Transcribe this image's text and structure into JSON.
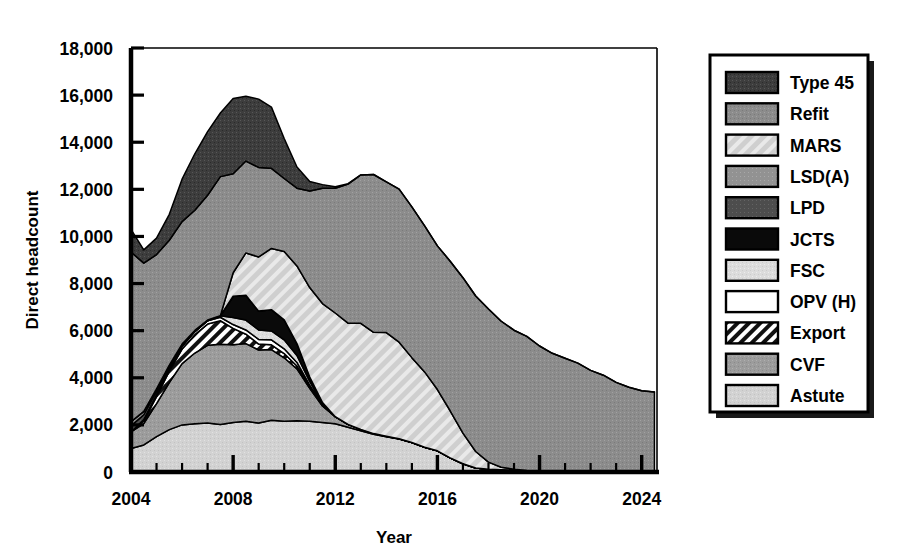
{
  "chart_data": {
    "type": "area",
    "stacked": true,
    "title": "",
    "xlabel": "Year",
    "ylabel": "Direct headcount",
    "xlim": [
      2004,
      2024.6
    ],
    "ylim": [
      0,
      18000
    ],
    "ytick_step": 2000,
    "xtick_major_step": 4,
    "xtick_minor_step": 1,
    "grid": false,
    "legend_position": "right-outside",
    "xticks": [
      2004,
      2008,
      2012,
      2016,
      2020,
      2024
    ],
    "xtick_labels": [
      "2004",
      "2008",
      "2012",
      "2016",
      "2020",
      "2024"
    ],
    "yticks": [
      0,
      2000,
      4000,
      6000,
      8000,
      10000,
      12000,
      14000,
      16000,
      18000
    ],
    "ytick_labels": [
      "0",
      "2,000",
      "4,000",
      "6,000",
      "8,000",
      "10,000",
      "12,000",
      "14,000",
      "16,000",
      "18,000"
    ],
    "x": [
      2004.0,
      2004.5,
      2005.0,
      2005.5,
      2006.0,
      2006.5,
      2007.0,
      2007.5,
      2008.0,
      2008.5,
      2009.0,
      2009.5,
      2010.0,
      2010.5,
      2011.0,
      2011.5,
      2012.0,
      2012.5,
      2013.0,
      2013.5,
      2014.0,
      2014.5,
      2015.0,
      2015.5,
      2016.0,
      2016.5,
      2017.0,
      2017.5,
      2018.0,
      2018.5,
      2019.0,
      2019.5,
      2020.0,
      2020.5,
      2021.0,
      2021.5,
      2022.0,
      2022.5,
      2023.0,
      2023.5,
      2024.0,
      2024.5
    ],
    "series": [
      {
        "name": "Astute",
        "swatch": "fill-astute",
        "values": [
          1000,
          1150,
          1500,
          1800,
          2000,
          2050,
          2080,
          2020,
          2100,
          2150,
          2080,
          2200,
          2150,
          2180,
          2150,
          2100,
          2050,
          1900,
          1750,
          1600,
          1500,
          1400,
          1250,
          1050,
          900,
          600,
          350,
          170,
          120,
          100,
          80,
          60,
          50,
          40,
          30,
          20,
          15,
          10,
          5,
          0,
          0,
          0
        ]
      },
      {
        "name": "CVF",
        "swatch": "fill-cvf",
        "values": [
          700,
          900,
          1400,
          2000,
          2600,
          3000,
          3300,
          3400,
          3300,
          3300,
          3100,
          3000,
          2700,
          2200,
          1400,
          700,
          300,
          120,
          60,
          30,
          20,
          10,
          5,
          0,
          0,
          0,
          0,
          0,
          0,
          0,
          0,
          0,
          0,
          0,
          0,
          0,
          0,
          0,
          0,
          0,
          0,
          0
        ]
      },
      {
        "name": "Export",
        "swatch": "fill-export",
        "values": [
          0,
          120,
          300,
          480,
          620,
          780,
          900,
          1000,
          700,
          400,
          250,
          200,
          180,
          120,
          60,
          20,
          0,
          0,
          0,
          0,
          0,
          0,
          0,
          0,
          0,
          0,
          0,
          0,
          0,
          0,
          0,
          0,
          0,
          0,
          0,
          0,
          0,
          0,
          0,
          0,
          0,
          0
        ]
      },
      {
        "name": "OPV (H)",
        "swatch": "fill-opv",
        "values": [
          0,
          60,
          90,
          110,
          120,
          130,
          140,
          150,
          160,
          180,
          200,
          210,
          200,
          150,
          80,
          30,
          0,
          0,
          0,
          0,
          0,
          0,
          0,
          0,
          0,
          0,
          0,
          0,
          0,
          0,
          0,
          0,
          0,
          0,
          0,
          0,
          0,
          0,
          0,
          0,
          0,
          0
        ]
      },
      {
        "name": "FSC",
        "swatch": "fill-fsc",
        "values": [
          0,
          0,
          0,
          0,
          0,
          0,
          0,
          60,
          300,
          420,
          400,
          380,
          380,
          300,
          160,
          60,
          0,
          0,
          0,
          0,
          0,
          0,
          0,
          0,
          0,
          0,
          0,
          0,
          0,
          0,
          0,
          0,
          0,
          0,
          0,
          0,
          0,
          0,
          0,
          0,
          0,
          0
        ]
      },
      {
        "name": "JCTS",
        "swatch": "fill-jcts",
        "values": [
          0,
          0,
          0,
          0,
          0,
          0,
          0,
          0,
          900,
          1050,
          800,
          900,
          850,
          500,
          180,
          40,
          0,
          0,
          0,
          0,
          0,
          0,
          0,
          0,
          0,
          0,
          0,
          0,
          0,
          0,
          0,
          0,
          0,
          0,
          0,
          0,
          0,
          0,
          0,
          0,
          0,
          0
        ]
      },
      {
        "name": "LPD",
        "swatch": "fill-lpd",
        "values": [
          260,
          200,
          140,
          90,
          50,
          30,
          20,
          10,
          0,
          0,
          0,
          0,
          0,
          0,
          0,
          0,
          0,
          0,
          0,
          0,
          0,
          0,
          0,
          0,
          0,
          0,
          0,
          0,
          0,
          0,
          0,
          0,
          0,
          0,
          0,
          0,
          0,
          0,
          0,
          0,
          0,
          0
        ]
      },
      {
        "name": "LSD(A)",
        "swatch": "fill-lsda",
        "values": [
          180,
          140,
          100,
          60,
          40,
          20,
          10,
          0,
          0,
          0,
          0,
          0,
          0,
          0,
          0,
          0,
          0,
          0,
          0,
          0,
          0,
          0,
          0,
          0,
          0,
          0,
          0,
          0,
          0,
          0,
          0,
          0,
          0,
          0,
          0,
          0,
          0,
          0,
          0,
          0,
          0,
          0
        ]
      },
      {
        "name": "MARS",
        "swatch": "fill-mars",
        "values": [
          0,
          0,
          0,
          0,
          0,
          0,
          0,
          0,
          1000,
          1800,
          2300,
          2600,
          2900,
          3300,
          3800,
          4200,
          4400,
          4300,
          4500,
          4300,
          4400,
          4100,
          3600,
          3200,
          2600,
          2000,
          1300,
          700,
          300,
          100,
          40,
          0,
          0,
          0,
          0,
          0,
          0,
          0,
          0,
          0,
          0,
          0
        ]
      },
      {
        "name": "Refit",
        "swatch": "fill-refit",
        "values": [
          7200,
          6300,
          5700,
          5300,
          5200,
          5100,
          5300,
          5900,
          4200,
          3900,
          3800,
          3400,
          3100,
          3300,
          4100,
          4900,
          5300,
          5900,
          6300,
          6700,
          6400,
          6500,
          6400,
          6200,
          6100,
          6350,
          6600,
          6600,
          6500,
          6200,
          5900,
          5700,
          5300,
          5000,
          4800,
          4600,
          4300,
          4100,
          3800,
          3600,
          3450,
          3400
        ]
      },
      {
        "name": "Type 45",
        "swatch": "fill-type45",
        "values": [
          960,
          560,
          700,
          1100,
          1800,
          2400,
          2700,
          2700,
          3200,
          2750,
          2900,
          2600,
          1700,
          900,
          400,
          150,
          60,
          20,
          0,
          0,
          0,
          0,
          0,
          0,
          0,
          0,
          0,
          0,
          0,
          0,
          0,
          0,
          0,
          0,
          0,
          0,
          0,
          0,
          0,
          0,
          0,
          0
        ]
      }
    ],
    "legend_entries": [
      {
        "label": "Type 45",
        "swatch": "fill-type45"
      },
      {
        "label": "Refit",
        "swatch": "fill-refit"
      },
      {
        "label": "MARS",
        "swatch": "fill-mars"
      },
      {
        "label": "LSD(A)",
        "swatch": "fill-lsda"
      },
      {
        "label": "LPD",
        "swatch": "fill-lpd"
      },
      {
        "label": "JCTS",
        "swatch": "fill-jcts"
      },
      {
        "label": "FSC",
        "swatch": "fill-fsc"
      },
      {
        "label": "OPV (H)",
        "swatch": "fill-opv"
      },
      {
        "label": "Export",
        "swatch": "fill-export"
      },
      {
        "label": "CVF",
        "swatch": "fill-cvf"
      },
      {
        "label": "Astute",
        "swatch": "fill-astute"
      }
    ],
    "colors": {
      "type45": "#3a3a3a",
      "refit": "#8a8a8a",
      "mars": "#c9c9c9",
      "lsda": "#8f8f8f",
      "lpd": "#4a4a4a",
      "jcts": "#0a0a0a",
      "fsc": "#d6d6d6",
      "opv": "#ffffff",
      "export": "#141414",
      "cvf": "#9e9e9e",
      "astute": "#d0d0d0",
      "axis": "#000000",
      "background": "#ffffff"
    }
  }
}
